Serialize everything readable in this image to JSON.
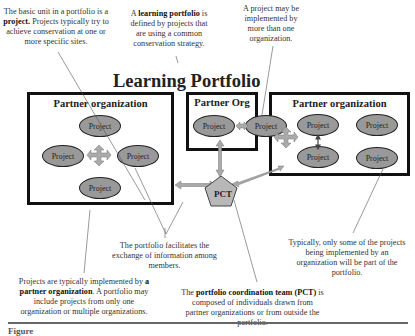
{
  "diagram": {
    "title": "Learning Portfolio",
    "notes": {
      "project_unit": {
        "pre": "The basic unit in a portfolio is a ",
        "bold": "project.",
        "post": " Projects typically try to achieve conservation at one or more specific sites."
      },
      "learning_portfolio": {
        "pre": "A ",
        "bold": "learning portfolio",
        "post": " is defined by projects that are using a common conservation strategy."
      },
      "multi_org": {
        "text": "A project may be implemented by more than one organization."
      },
      "info_exchange": {
        "text": "The portfolio facilitates the exchange of information among members."
      },
      "partner_org": {
        "pre": "Projects are typically implemented by ",
        "bold": "a partner organization",
        "post": ". A portfolio may include projects from only one organization or multiple organizations."
      },
      "pct": {
        "pre": "The ",
        "bold": "portfolio coordination team",
        "bold2": "(PCT)",
        "post": " is composed of individuals drawn from partner organizations or from outside the portfolio."
      },
      "some_projects": {
        "text": "Typically, only some of the projects being implemented by an organization will be part of the portfolio."
      }
    },
    "organizations": [
      {
        "label": "Partner organization",
        "projects": [
          "Project",
          "Project",
          "Project",
          "Project"
        ]
      },
      {
        "label": "Partner Org",
        "projects": [
          "Project"
        ]
      },
      {
        "label": "Partner organization",
        "projects": [
          "Project",
          "Project",
          "Project",
          "Project"
        ]
      }
    ],
    "shared_project": "Project",
    "pct_label": "PCT",
    "caption": "Figure"
  },
  "colors": {
    "project_fill": "#999999",
    "arrow_fill": "#aaaaaa",
    "pct_fill": "#b8b8b8",
    "border": "#111111"
  }
}
